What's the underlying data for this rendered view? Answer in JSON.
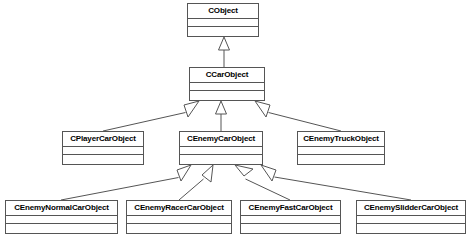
{
  "diagram": {
    "type": "uml-class-diagram",
    "title": "",
    "background_color": "#ffffff",
    "box_border_color": "#555555",
    "box_fill_color": "#ffffff",
    "edge_color": "#555555",
    "relationship_type": "generalization",
    "classes": [
      {
        "id": "cobject",
        "name": "CObject",
        "x": 187,
        "y": 3,
        "w": 72,
        "h": 34,
        "attributes": [],
        "operations": []
      },
      {
        "id": "ccarobject",
        "name": "CCarObject",
        "x": 189,
        "y": 67,
        "w": 76,
        "h": 34,
        "attributes": [],
        "operations": []
      },
      {
        "id": "cplayercarobject",
        "name": "CPlayerCarObject",
        "x": 62,
        "y": 131,
        "w": 82,
        "h": 34,
        "attributes": [],
        "operations": []
      },
      {
        "id": "cenemycarobject",
        "name": "CEnemyCarObject",
        "x": 179,
        "y": 131,
        "w": 84,
        "h": 34,
        "attributes": [],
        "operations": []
      },
      {
        "id": "cenemytruckobject",
        "name": "CEnemyTruckObject",
        "x": 297,
        "y": 131,
        "w": 88,
        "h": 34,
        "attributes": [],
        "operations": []
      },
      {
        "id": "cenemynormalcarobject",
        "name": "CEnemyNormalCarObject",
        "x": 5,
        "y": 200,
        "w": 113,
        "h": 34,
        "attributes": [],
        "operations": []
      },
      {
        "id": "cenemyracercarobject",
        "name": "CEnemyRacerCarObject",
        "x": 126,
        "y": 200,
        "w": 106,
        "h": 34,
        "attributes": [],
        "operations": []
      },
      {
        "id": "cenemyfastcarobject",
        "name": "CEnemyFastCarObject",
        "x": 240,
        "y": 200,
        "w": 101,
        "h": 34,
        "attributes": [],
        "operations": []
      },
      {
        "id": "cenemyslidercarobject",
        "name": "CEnemySlidderCarObject",
        "x": 356,
        "y": 200,
        "w": 110,
        "h": 34,
        "attributes": [],
        "operations": []
      }
    ],
    "relationships": [
      {
        "from": "ccarobject",
        "to": "cobject",
        "kind": "inheritance"
      },
      {
        "from": "cplayercarobject",
        "to": "ccarobject",
        "kind": "inheritance"
      },
      {
        "from": "cenemycarobject",
        "to": "ccarobject",
        "kind": "inheritance"
      },
      {
        "from": "cenemytruckobject",
        "to": "ccarobject",
        "kind": "inheritance"
      },
      {
        "from": "cenemynormalcarobject",
        "to": "cenemycarobject",
        "kind": "inheritance"
      },
      {
        "from": "cenemyracercarobject",
        "to": "cenemycarobject",
        "kind": "inheritance"
      },
      {
        "from": "cenemyfastcarobject",
        "to": "cenemycarobject",
        "kind": "inheritance"
      },
      {
        "from": "cenemyslidercarobject",
        "to": "cenemycarobject",
        "kind": "inheritance"
      }
    ]
  }
}
